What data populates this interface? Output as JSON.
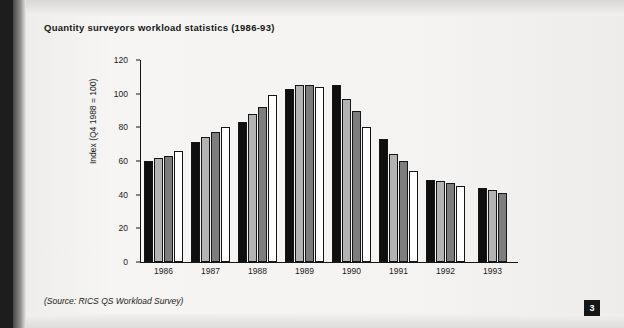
{
  "page": {
    "number": "3",
    "title": "Quantity surveyors workload statistics (1986-93)",
    "source_note": "(Source: RICS QS Workload Survey)"
  },
  "chart_data": {
    "type": "bar",
    "title": "Quantity surveyors workload statistics (1986-93)",
    "xlabel": "",
    "ylabel": "Index (Q4 1988 = 100)",
    "ylim": [
      0,
      120
    ],
    "yticks": [
      0,
      20,
      40,
      60,
      80,
      100,
      120
    ],
    "ytick_labels": [
      "0",
      "20",
      "40",
      "60",
      "80",
      "100",
      "120"
    ],
    "grid": false,
    "legend": "none",
    "categories": [
      "1986",
      "1987",
      "1988",
      "1989",
      "1990",
      "1991",
      "1992",
      "1993"
    ],
    "series": [
      {
        "name": "Q1",
        "color": "#0f0f0f",
        "values": [
          60,
          71,
          83,
          103,
          105,
          73,
          49,
          44
        ]
      },
      {
        "name": "Q2",
        "color": "#b3b3b3",
        "values": [
          62,
          74,
          88,
          105,
          97,
          64,
          48,
          43
        ]
      },
      {
        "name": "Q3",
        "color": "#7d7d7d",
        "values": [
          63,
          77,
          92,
          105,
          90,
          60,
          47,
          41
        ]
      },
      {
        "name": "Q4",
        "color": "#ffffff",
        "values": [
          66,
          80,
          99,
          104,
          80,
          54,
          45,
          null
        ]
      }
    ],
    "annotations": [
      "(Source: RICS QS Workload Survey)"
    ]
  }
}
